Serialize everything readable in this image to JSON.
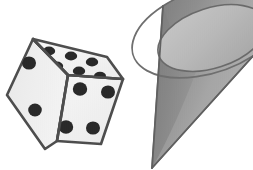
{
  "canvas": {
    "width": 253,
    "height": 170,
    "background": "#ffffff",
    "description": "Two grayscale 3D solids on a plain white background: a die (cube) at left and an inverted cone at right"
  },
  "palette": {
    "background": "#ffffff",
    "outline": "#3a3a3a",
    "die_face_top": "#f2f2f2",
    "die_face_left": "#eaeaea",
    "die_face_right": "#efefef",
    "die_pip": "#121212",
    "cone_ellipse_light": "#b4b4b4",
    "cone_ellipse_dark": "#9a9a9a",
    "cone_body_light": "#a8a8a8",
    "cone_body_mid": "#8f8f8f",
    "cone_body_dark": "#6f6f6f",
    "cone_outline": "#5a5a5a"
  },
  "objects": [
    {
      "id": "die",
      "name": "Die",
      "shape": "cube",
      "label": "die",
      "faces": [
        {
          "id": "die-face-top",
          "name": "top face",
          "pip_count": 6,
          "fill": "#f2f2f2"
        },
        {
          "id": "die-face-left",
          "name": "left face",
          "pip_count": 2,
          "fill": "#eaeaea"
        },
        {
          "id": "die-face-right",
          "name": "right face",
          "pip_count": 4,
          "fill": "#efefef"
        }
      ],
      "total_visible_pips": 12,
      "bounds": {
        "x": 6,
        "y": 36,
        "width": 118,
        "height": 114
      }
    },
    {
      "id": "cone",
      "name": "Cone",
      "shape": "cone",
      "label": "cone",
      "orientation": "inverted, apex pointing down-left",
      "apex": {
        "x": 152,
        "y": 168
      },
      "base_ellipse": {
        "cx": 212,
        "cy": 38,
        "rx": 56,
        "ry": 30,
        "rotation_deg": -18
      },
      "bounds": {
        "x": 150,
        "y": 0,
        "width": 103,
        "height": 170
      }
    }
  ],
  "geometry": {
    "die": {
      "vertex_left": "7,95",
      "vertex_top_left": "33,39",
      "vertex_top_right": "107,57",
      "vertex_right": "123,79",
      "vertex_center": "68,75",
      "vertex_bottom_left": "45,149",
      "vertex_bottom_mid": "57,141",
      "vertex_bottom_right": "101,144",
      "face_top_path": "33,39 107,57 123,79 68,75",
      "face_left_path": "7,95 33,39 68,75 57,141 45,149",
      "face_right_path": "68,75 123,79 101,144 57,141"
    },
    "die_pips": {
      "top": [
        "49,51",
        "71,56",
        "92,62",
        "57,66",
        "79,71",
        "100,76"
      ],
      "left": [
        "29,63",
        "35,110"
      ],
      "right": [
        "80,89",
        "108,92",
        "66,127",
        "93,128"
      ]
    },
    "cone": {
      "left_silhouette": "163,6 152,168",
      "right_silhouette": "253,56 152,168",
      "base_front_arc": "from 163,6 sweeping down-right through 200,68 to 253,56",
      "base_back_arc": "from 163,6 sweeping up-right through 205,2 to 253,56"
    }
  }
}
